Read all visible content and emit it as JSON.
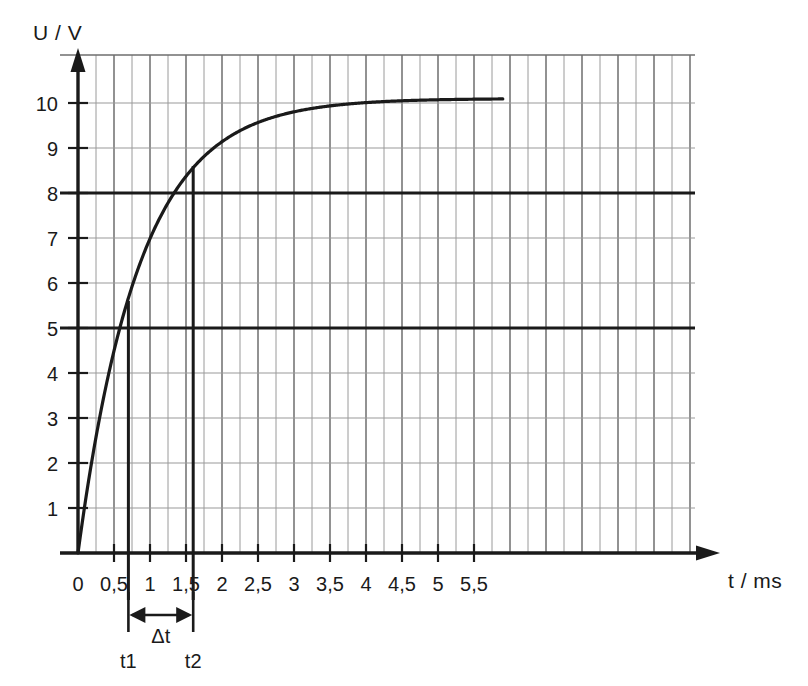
{
  "chart_data": {
    "type": "line",
    "title": "",
    "xlabel": "t / ms",
    "ylabel": "U / V",
    "xlim": [
      0,
      5.9
    ],
    "ylim": [
      0,
      10.6
    ],
    "grid": true,
    "legend_position": "none",
    "x_ticks": [
      "0",
      "0,5",
      "1",
      "1,5",
      "2",
      "2,5",
      "3",
      "3,5",
      "4",
      "4,5",
      "5",
      "5,5"
    ],
    "x_tick_values": [
      0,
      0.5,
      1,
      1.5,
      2,
      2.5,
      3,
      3.5,
      4,
      4.5,
      5,
      5.5
    ],
    "y_ticks": [
      "1",
      "2",
      "3",
      "4",
      "5",
      "6",
      "7",
      "8",
      "9",
      "10"
    ],
    "y_tick_values": [
      1,
      2,
      3,
      4,
      5,
      6,
      7,
      8,
      9,
      10
    ],
    "curve_description": "Exponential capacitor charging curve U(t) = 10.1 * (1 - exp(-t / 0.85)) V",
    "asymptote": 10.1,
    "tau": 0.85,
    "series": [
      {
        "name": "U(t)",
        "x": [
          0,
          0.1,
          0.2,
          0.3,
          0.4,
          0.5,
          0.6,
          0.7,
          0.8,
          0.9,
          1.0,
          1.2,
          1.4,
          1.6,
          1.8,
          2.0,
          2.25,
          2.5,
          2.75,
          3.0,
          3.25,
          3.5,
          3.75,
          4.0,
          4.25,
          4.5,
          4.75,
          5.0,
          5.25,
          5.5,
          5.75,
          5.9
        ],
        "values": [
          0,
          1.12,
          2.12,
          3.01,
          3.8,
          4.5,
          5.13,
          5.68,
          6.18,
          6.62,
          7.01,
          7.66,
          8.18,
          8.58,
          8.92,
          9.18,
          9.44,
          9.63,
          9.77,
          9.86,
          9.94,
          9.99,
          10.02,
          10.05,
          10.07,
          10.08,
          10.09,
          10.09,
          10.1,
          10.1,
          10.1,
          10.1
        ]
      }
    ],
    "reference_lines": [
      {
        "name": "u1",
        "orientation": "horizontal",
        "value": 5,
        "style": "bold"
      },
      {
        "name": "u2",
        "orientation": "horizontal",
        "value": 8,
        "style": "bold"
      },
      {
        "name": "t1",
        "orientation": "vertical",
        "value": 0.7,
        "style": "bold"
      },
      {
        "name": "t2",
        "orientation": "vertical",
        "value": 1.6,
        "style": "bold"
      }
    ],
    "annotations": [
      {
        "name": "t1",
        "label": "t1",
        "x": 0.7,
        "type": "axis-marker"
      },
      {
        "name": "t2",
        "label": "t2",
        "x": 1.6,
        "type": "axis-marker"
      },
      {
        "name": "delta-t",
        "label": "Δt",
        "from": 0.7,
        "to": 1.6,
        "type": "double-arrow"
      }
    ]
  },
  "labels": {
    "y_axis_title": "U / V",
    "x_axis_title": "t / ms",
    "t1": "t1",
    "t2": "t2",
    "delta_t": "Δt"
  },
  "colors": {
    "curve": "#1a1a1a",
    "axis": "#1a1a1a",
    "grid_minor": "#9a9a9a",
    "grid_major": "#6e6e6e",
    "background": "#ffffff"
  }
}
